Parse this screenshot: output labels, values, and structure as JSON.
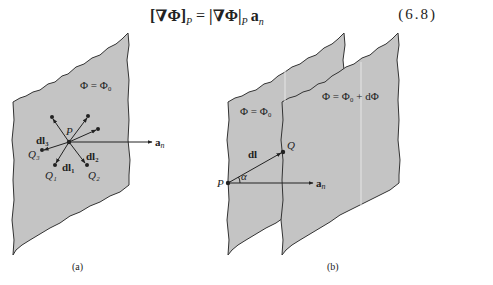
{
  "equation": {
    "lhs": "[∇Φ]",
    "lhs_sub": "P",
    "equals": " = ",
    "rhs": "|∇Φ|",
    "rhs_sub": "P",
    "rhs_vec": "a",
    "rhs_vec_sub": "n",
    "number": "(6.8)"
  },
  "figure_a": {
    "plane_label": "Φ = Φ₀",
    "point_P": "P",
    "vec_dl1": "dl₁",
    "vec_dl2": "dl₂",
    "vec_dl3": "dl₃",
    "point_Q1": "Q₁",
    "point_Q2": "Q₂",
    "point_Q3": "Q₃",
    "normal": "a",
    "normal_sub": "n",
    "caption": "(a)"
  },
  "figure_b": {
    "plane1_label": "Φ = Φ₀",
    "plane2_label": "Φ = Φ₀ + dΦ",
    "point_P": "P",
    "point_Q": "Q",
    "vec_dl": "dl",
    "angle": "α",
    "normal": "a",
    "normal_sub": "n",
    "caption": "(b)"
  },
  "colors": {
    "plane_fill": "#c4c4c4",
    "outline": "#333333"
  }
}
